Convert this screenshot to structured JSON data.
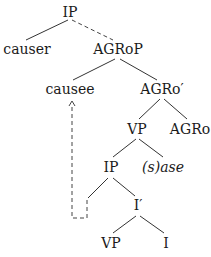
{
  "diagram": {
    "type": "syntax-tree",
    "nodes": {
      "ip_root": "IP",
      "causer": "causer",
      "agrop": "AGRoP",
      "causee": "causee",
      "agro_bar": "AGRo′",
      "vp_upper": "VP",
      "agro_head": "AGRo",
      "ip_lower": "IP",
      "sase": "(s)ase",
      "i_bar": "I′",
      "vp_lower": "VP",
      "i_head": "I"
    },
    "edges": [
      {
        "from": "IP",
        "to": "causer",
        "style": "solid"
      },
      {
        "from": "IP",
        "to": "AGRoP",
        "style": "dashed"
      },
      {
        "from": "AGRoP",
        "to": "causee",
        "style": "solid"
      },
      {
        "from": "AGRoP",
        "to": "AGRo′",
        "style": "solid"
      },
      {
        "from": "AGRo′",
        "to": "VP",
        "style": "solid"
      },
      {
        "from": "AGRo′",
        "to": "AGRo",
        "style": "solid"
      },
      {
        "from": "VP",
        "to": "IP",
        "style": "solid"
      },
      {
        "from": "VP",
        "to": "(s)ase",
        "style": "solid"
      },
      {
        "from": "IP",
        "to": "(empty specifier)",
        "style": "solid"
      },
      {
        "from": "IP",
        "to": "I′",
        "style": "solid"
      },
      {
        "from": "I′",
        "to": "VP",
        "style": "solid"
      },
      {
        "from": "I′",
        "to": "I",
        "style": "solid"
      }
    ],
    "movement": {
      "from": "specifier of lower IP",
      "to": "causee",
      "style": "dashed-arrow"
    }
  }
}
